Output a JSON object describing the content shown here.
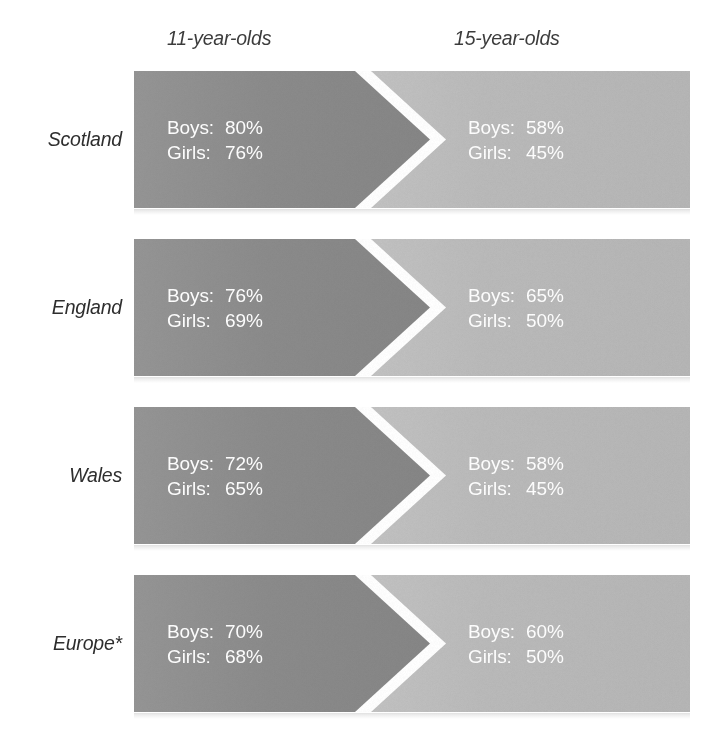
{
  "chart_data": {
    "type": "bar",
    "title": "",
    "subtitle": "",
    "xlabel": "",
    "ylabel": "",
    "grid": false,
    "legend_position": "top",
    "categories": [
      "Scotland",
      "England",
      "Wales",
      "Europe*"
    ],
    "column_headers": [
      "11-year-olds",
      "15-year-olds"
    ],
    "row_keys": [
      "Boys:",
      "Girls:"
    ],
    "series": [
      {
        "name": "11-year-olds Boys",
        "values": [
          80,
          76,
          72,
          70
        ]
      },
      {
        "name": "11-year-olds Girls",
        "values": [
          76,
          69,
          65,
          68
        ]
      },
      {
        "name": "15-year-olds Boys",
        "values": [
          58,
          65,
          58,
          60
        ]
      },
      {
        "name": "15-year-olds Girls",
        "values": [
          45,
          50,
          45,
          50
        ]
      }
    ],
    "units": "%",
    "ylim": [
      0,
      100
    ]
  },
  "header": {
    "col1": "11-year-olds",
    "col2": "15-year-olds"
  },
  "colors": {
    "dark_band": "#8d8d8d",
    "light_band": "#bbbbbb",
    "gap": "#ffffff",
    "value_text": "#ffffff",
    "label_text": "#2e2e2e",
    "page_background": "#ffffff"
  },
  "rows": [
    {
      "label": "Scotland",
      "left": {
        "boys_key": "Boys:",
        "boys_value": "80%",
        "girls_key": "Girls:",
        "girls_value": "76%"
      },
      "right": {
        "boys_key": "Boys:",
        "boys_value": "58%",
        "girls_key": "Girls:",
        "girls_value": "45%"
      }
    },
    {
      "label": "England",
      "left": {
        "boys_key": "Boys:",
        "boys_value": "76%",
        "girls_key": "Girls:",
        "girls_value": "69%"
      },
      "right": {
        "boys_key": "Boys:",
        "boys_value": "65%",
        "girls_key": "Girls:",
        "girls_value": "50%"
      }
    },
    {
      "label": "Wales",
      "left": {
        "boys_key": "Boys:",
        "boys_value": "72%",
        "girls_key": "Girls:",
        "girls_value": "65%"
      },
      "right": {
        "boys_key": "Boys:",
        "boys_value": "58%",
        "girls_key": "Girls:",
        "girls_value": "45%"
      }
    },
    {
      "label": "Europe*",
      "left": {
        "boys_key": "Boys:",
        "boys_value": "70%",
        "girls_key": "Girls:",
        "girls_value": "68%"
      },
      "right": {
        "boys_key": "Boys:",
        "boys_value": "60%",
        "girls_key": "Girls:",
        "girls_value": "50%"
      }
    }
  ]
}
